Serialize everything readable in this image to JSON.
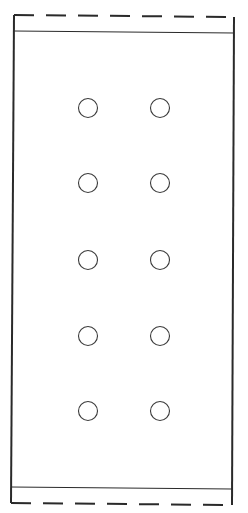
{
  "diagram": {
    "type": "pin-layout outline",
    "stroke_color": "#2a2a2a",
    "background": "#ffffff",
    "outline": {
      "top_left": [
        14,
        15
      ],
      "top_right": [
        234,
        17
      ],
      "bottom_left": [
        11,
        503
      ],
      "bottom_right": [
        232,
        505
      ]
    },
    "inner_lines": {
      "top": {
        "y_left": 31,
        "y_right": 33
      },
      "bottom": {
        "y_left": 487,
        "y_right": 489
      }
    },
    "dashed_edges": [
      "top",
      "bottom"
    ],
    "holes": {
      "columns": [
        88,
        160
      ],
      "rows": [
        108,
        183,
        260,
        336,
        411
      ],
      "radius": 9.5,
      "count": 10
    }
  }
}
